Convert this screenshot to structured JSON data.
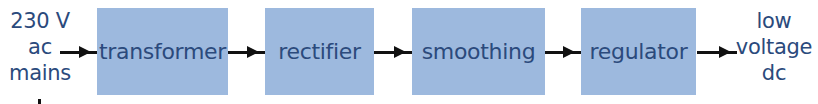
{
  "diagram": {
    "type": "block-diagram",
    "title": "",
    "input": {
      "lines": [
        "230 V",
        "ac",
        "mains"
      ]
    },
    "stages": [
      {
        "label": "transformer"
      },
      {
        "label": "rectifier"
      },
      {
        "label": "smoothing"
      },
      {
        "label": "regulator"
      }
    ],
    "output": {
      "lines": [
        "low",
        "voltage",
        "dc"
      ]
    },
    "colors": {
      "box_fill": "#9db9de",
      "text": "#2b4a7c",
      "arrow": "#111111"
    }
  }
}
